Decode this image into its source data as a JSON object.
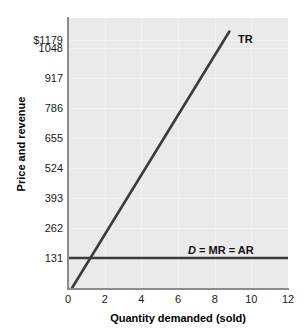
{
  "chart_data": {
    "type": "line",
    "title": "",
    "xlabel": "Quantity demanded (sold)",
    "ylabel": "Price and revenue",
    "xlim": [
      0,
      12
    ],
    "ylim": [
      0,
      1179
    ],
    "grid": true,
    "legend_position": "inline-annotations",
    "xticks": [
      "0",
      "2",
      "4",
      "6",
      "8",
      "10",
      "12"
    ],
    "xtick_values": [
      0,
      2,
      4,
      6,
      8,
      10,
      12
    ],
    "yticks": [
      "131",
      "262",
      "393",
      "524",
      "655",
      "786",
      "917",
      "1048",
      "$1179"
    ],
    "ytick_values": [
      131,
      262,
      393,
      524,
      655,
      786,
      917,
      1048,
      1179
    ],
    "series": [
      {
        "name": "TR",
        "label": "TR",
        "color": "#3b3b3b",
        "x": [
          0.22,
          8.8
        ],
        "values": [
          0,
          1120
        ]
      },
      {
        "name": "D = MR = AR",
        "label_parts": {
          "italic": "D",
          "rest": " = MR = AR"
        },
        "label": "D = MR = AR",
        "color": "#3b3b3b",
        "x": [
          0,
          12
        ],
        "values": [
          131,
          131
        ]
      }
    ],
    "annotations": [
      {
        "text": "TR",
        "x": 9.3,
        "y": 1140
      },
      {
        "text": "D = MR = AR",
        "x": 6.6,
        "y": 215
      }
    ]
  },
  "axis": {
    "y_title": "Price and revenue",
    "x_title": "Quantity demanded (sold)"
  }
}
